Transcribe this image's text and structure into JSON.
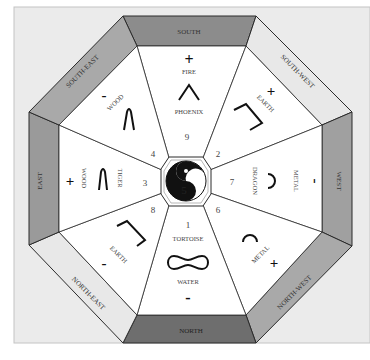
{
  "colors": {
    "frame_bg": "#ebebeb",
    "frame_border": "#bdbdbd",
    "segment_fill": "#ffffff",
    "line": "#2b2b2b",
    "ring_south": "#8c8c8c",
    "ring_north": "#6e6e6e",
    "ring_east": "#9a9a9a",
    "ring_west": "#a0a0a0",
    "ring_south_east": "#a9a9a9",
    "ring_north_west": "#a9a9a9",
    "ring_south_west": "#e8e8e8",
    "ring_north_east": "#e8e8e8",
    "text": "#4a4a4a",
    "symbol": "#111111"
  },
  "directions": {
    "south": "SOUTH",
    "south_west": "SOUTH-WEST",
    "west": "WEST",
    "north_west": "NORTH-WEST",
    "north": "NORTH",
    "north_east": "NORTH-EAST",
    "east": "EAST",
    "south_east": "SOUTH-EAST"
  },
  "segments": {
    "south": {
      "number": "9",
      "element": "FIRE",
      "animal": "PHOENIX",
      "polarity": "+"
    },
    "south_west": {
      "number": "2",
      "element": "EARTH",
      "polarity": "+"
    },
    "west": {
      "number": "7",
      "element": "METAL",
      "animal": "DRAGON",
      "polarity": "-"
    },
    "north_west": {
      "number": "6",
      "element": "METAL",
      "polarity": "+"
    },
    "north": {
      "number": "1",
      "element": "WATER",
      "animal": "TORTOISE",
      "polarity": "-"
    },
    "north_east": {
      "number": "8",
      "element": "EARTH",
      "polarity": "-"
    },
    "east": {
      "number": "3",
      "element": "WOOD",
      "animal": "TIGER",
      "polarity": "+"
    },
    "south_east": {
      "number": "4",
      "element": "WOOD",
      "polarity": "-"
    }
  },
  "center": {
    "number": "5",
    "symbol": "yin-yang"
  }
}
